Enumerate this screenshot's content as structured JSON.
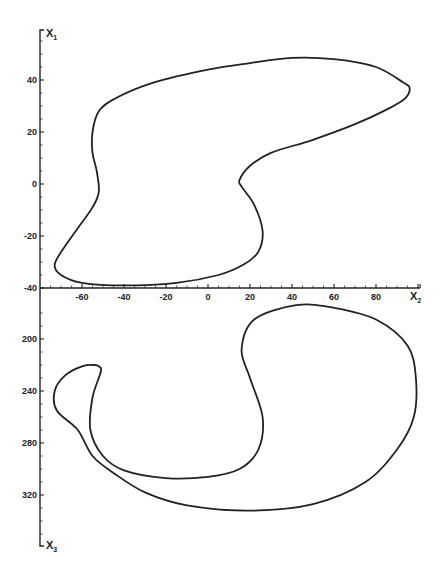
{
  "chart_data": [
    {
      "type": "line",
      "title": "",
      "description": "Phase-space trajectory (closed orbit) projected onto x2–x1 plane",
      "xlabel": "X2",
      "ylabel": "X1",
      "xlim": [
        -80,
        101
      ],
      "ylim": [
        -40,
        60
      ],
      "x_ticks": [
        -60,
        -40,
        -20,
        0,
        20,
        40,
        60,
        80
      ],
      "y_ticks": [
        -40,
        -20,
        0,
        20,
        40
      ],
      "grid": false,
      "series": [
        {
          "name": "orbit (x2, x1)",
          "closed": true,
          "points": [
            [
              -55,
              20
            ],
            [
              -52,
              28
            ],
            [
              -44,
              33
            ],
            [
              -26,
              39
            ],
            [
              0,
              44
            ],
            [
              20,
              46.5
            ],
            [
              40,
              48.5
            ],
            [
              60,
              48
            ],
            [
              80,
              45
            ],
            [
              93,
              39
            ],
            [
              96,
              37
            ],
            [
              94,
              33
            ],
            [
              86,
              29
            ],
            [
              70,
              23
            ],
            [
              50,
              17
            ],
            [
              30,
              12
            ],
            [
              20,
              7
            ],
            [
              15,
              1.5
            ],
            [
              16,
              -1
            ],
            [
              22,
              -8
            ],
            [
              26,
              -18
            ],
            [
              24,
              -26
            ],
            [
              17,
              -31
            ],
            [
              5,
              -35
            ],
            [
              -15,
              -38
            ],
            [
              -40,
              -39
            ],
            [
              -60,
              -38
            ],
            [
              -70,
              -35
            ],
            [
              -73,
              -31
            ],
            [
              -69,
              -25
            ],
            [
              -62,
              -17
            ],
            [
              -55,
              -9
            ],
            [
              -52,
              -3
            ],
            [
              -53,
              5
            ],
            [
              -55,
              12
            ],
            [
              -55,
              20
            ]
          ]
        }
      ]
    },
    {
      "type": "line",
      "title": "",
      "description": "Same trajectory projected onto x2–x3 plane (x3 axis increasing downward)",
      "xlabel": "X2",
      "ylabel": "X3",
      "xlim": [
        -80,
        101
      ],
      "ylim": [
        170,
        360
      ],
      "y_inverted": true,
      "y_ticks": [
        200,
        240,
        280,
        320
      ],
      "grid": false,
      "series": [
        {
          "name": "orbit (x2, x3)",
          "closed": true,
          "points": [
            [
              -54,
              220
            ],
            [
              -52,
              221
            ],
            [
              -51,
              225
            ],
            [
              -55,
              245
            ],
            [
              -56,
              270
            ],
            [
              -50,
              290
            ],
            [
              -40,
              301
            ],
            [
              -20,
              307
            ],
            [
              0,
              306
            ],
            [
              15,
              300
            ],
            [
              24,
              285
            ],
            [
              26,
              260
            ],
            [
              20,
              230
            ],
            [
              16,
              208
            ],
            [
              22,
              185
            ],
            [
              42,
              174
            ],
            [
              60,
              176
            ],
            [
              80,
              185
            ],
            [
              95,
              205
            ],
            [
              99,
              230
            ],
            [
              98,
              260
            ],
            [
              90,
              285
            ],
            [
              75,
              310
            ],
            [
              50,
              327
            ],
            [
              20,
              332
            ],
            [
              -10,
              328
            ],
            [
              -30,
              318
            ],
            [
              -45,
              303
            ],
            [
              -55,
              290
            ],
            [
              -62,
              270
            ],
            [
              -72,
              255
            ],
            [
              -73,
              240
            ],
            [
              -68,
              228
            ],
            [
              -60,
              221
            ],
            [
              -54,
              220
            ]
          ]
        }
      ]
    }
  ],
  "axes": {
    "upper": {
      "y_label": "X",
      "y_label_sub": "1",
      "y_tick_labels": [
        "40",
        "20",
        "0",
        "-20",
        "-40"
      ],
      "x_label": "X",
      "x_label_sub": "2",
      "x_tick_labels": [
        "-60",
        "-40",
        "-20",
        "0",
        "20",
        "40",
        "60",
        "80"
      ]
    },
    "lower": {
      "y_label": "X",
      "y_label_sub": "3",
      "y_tick_labels": [
        "200",
        "240",
        "280",
        "320"
      ]
    }
  },
  "colors": {
    "ink": "#222222",
    "background": "#ffffff"
  }
}
